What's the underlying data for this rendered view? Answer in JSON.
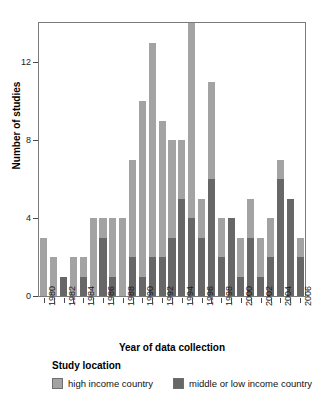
{
  "chart_data": {
    "type": "bar",
    "subtype": "stacked",
    "title": "",
    "xlabel": "Year of data collection",
    "ylabel": "Number of studies",
    "ylim": [
      0,
      14
    ],
    "yticks": [
      0,
      4,
      8,
      12
    ],
    "ytick_labels": [
      "0",
      "4",
      "8",
      "12"
    ],
    "grid": false,
    "legend_title": "Study location",
    "legend_position": "bottom",
    "categories": [
      "1980",
      "1981",
      "1982",
      "1983",
      "1984",
      "1985",
      "1986",
      "1987",
      "1988",
      "1989",
      "1990",
      "1991",
      "1992",
      "1993",
      "1994",
      "1995",
      "1996",
      "1997",
      "1998",
      "1999",
      "2000",
      "2001",
      "2002",
      "2003",
      "2004",
      "2005",
      "2006"
    ],
    "xtick_labels": [
      "1980",
      "",
      "1982",
      "",
      "1984",
      "",
      "1986",
      "",
      "1988",
      "",
      "1990",
      "",
      "1992",
      "",
      "1994",
      "",
      "1996",
      "",
      "1998",
      "",
      "2000",
      "",
      "2002",
      "",
      "2004",
      "",
      "2006"
    ],
    "series": [
      {
        "name": "high income country",
        "color": "#a3a3a3",
        "values": [
          3,
          2,
          0,
          2,
          1,
          4,
          1,
          3,
          4,
          5,
          9,
          11,
          7,
          5,
          3,
          10,
          2,
          5,
          2,
          0,
          2,
          2,
          2,
          2,
          1,
          0,
          1
        ]
      },
      {
        "name": "middle or low income country",
        "color": "#676767",
        "values": [
          0,
          0,
          1,
          0,
          1,
          0,
          3,
          1,
          0,
          2,
          1,
          2,
          2,
          3,
          5,
          4,
          3,
          6,
          2,
          4,
          1,
          3,
          1,
          2,
          6,
          5,
          2
        ]
      }
    ],
    "totals": [
      3,
      2,
      1,
      2,
      2,
      4,
      4,
      4,
      4,
      7,
      10,
      13,
      9,
      8,
      8,
      14,
      5,
      11,
      4,
      4,
      3,
      5,
      3,
      4,
      7,
      5,
      3
    ]
  },
  "legend": {
    "title": "Study location",
    "items": [
      {
        "label": "high income country",
        "swatch": "light-gray-swatch"
      },
      {
        "label": "middle or low income country",
        "swatch": "dark-gray-swatch"
      }
    ]
  },
  "axes": {
    "y_title": "Number of studies",
    "x_title": "Year of data collection"
  }
}
